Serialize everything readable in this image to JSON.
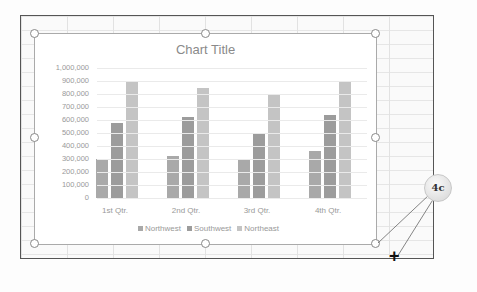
{
  "callout": {
    "label": "4c"
  },
  "chart_data": {
    "type": "bar",
    "title": "Chart Title",
    "categories": [
      "1st Qtr.",
      "2nd Qtr.",
      "3rd Qtr.",
      "4th Qtr."
    ],
    "series": [
      {
        "name": "Northwest",
        "values": [
          300000,
          320000,
          290000,
          360000
        ],
        "color": "#a9a9a9"
      },
      {
        "name": "Southwest",
        "values": [
          580000,
          620000,
          490000,
          640000
        ],
        "color": "#9c9c9c"
      },
      {
        "name": "Northeast",
        "values": [
          890000,
          850000,
          800000,
          890000
        ],
        "color": "#c4c4c4"
      }
    ],
    "y_ticks": [
      "0",
      "100,000",
      "200,000",
      "300,000",
      "400,000",
      "500,000",
      "600,000",
      "700,000",
      "800,000",
      "900,000",
      "1,000,000"
    ],
    "ylim": [
      0,
      1000000
    ],
    "xlabel": "",
    "ylabel": "",
    "grid": true,
    "legend_position": "bottom"
  }
}
